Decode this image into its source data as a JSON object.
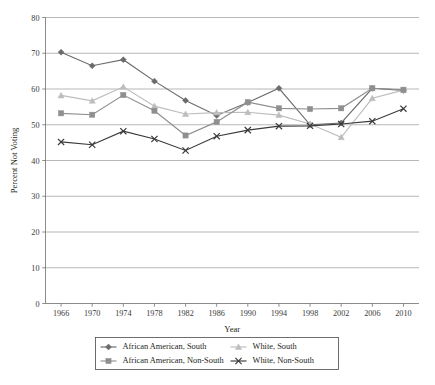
{
  "chart_data": {
    "type": "line",
    "title": "",
    "xlabel": "Year",
    "ylabel": "Percent Not Voting",
    "xlim": [
      1964,
      2012
    ],
    "ylim": [
      0,
      80
    ],
    "ytick_step": 10,
    "grid": "horizontal",
    "legend_position": "bottom",
    "x": [
      1966,
      1970,
      1974,
      1978,
      1982,
      1986,
      1990,
      1994,
      1998,
      2002,
      2006,
      2010
    ],
    "xtick_labels": [
      "1966",
      "1970",
      "1974",
      "1978",
      "1982",
      "1986",
      "1990",
      "1994",
      "1998",
      "2002",
      "2006",
      "2010"
    ],
    "ytick_labels": [
      "0",
      "10",
      "20",
      "30",
      "40",
      "50",
      "60",
      "70",
      "80"
    ],
    "series": [
      {
        "name": "African American, South",
        "marker": "diamond",
        "color": "#6b6b6b",
        "values": [
          70.3,
          66.5,
          68.2,
          62.2,
          56.8,
          52.6,
          56.2,
          60.2,
          50.0,
          50.5,
          60.2,
          59.6
        ]
      },
      {
        "name": "White, South",
        "marker": "triangle",
        "color": "#bdbdbd",
        "values": [
          58.2,
          56.7,
          60.6,
          55.2,
          53.0,
          53.4,
          53.5,
          52.7,
          50.2,
          46.5,
          57.4,
          59.7
        ]
      },
      {
        "name": "African American, Non-South",
        "marker": "square",
        "color": "#8f8f8f",
        "values": [
          53.2,
          52.8,
          58.3,
          53.9,
          47.0,
          50.8,
          56.3,
          54.6,
          54.4,
          54.6,
          60.2,
          59.8
        ]
      },
      {
        "name": "White, Non-South",
        "marker": "cross",
        "color": "#3a3a3a",
        "values": [
          45.2,
          44.4,
          48.2,
          46.0,
          42.8,
          46.8,
          48.5,
          49.6,
          49.7,
          50.2,
          51.0,
          54.5
        ]
      }
    ]
  },
  "legend": {
    "entries": [
      {
        "label": "African American, South"
      },
      {
        "label": "White, South"
      },
      {
        "label": "African American, Non-South"
      },
      {
        "label": "White, Non-South"
      }
    ]
  }
}
